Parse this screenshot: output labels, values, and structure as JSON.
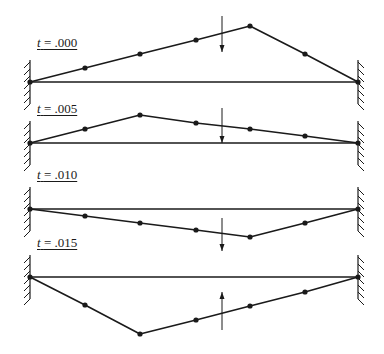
{
  "diagram": {
    "title": "",
    "colors": {
      "line": "#1a1a1a",
      "background": "#ffffff"
    },
    "panels": [
      {
        "time_var": "t",
        "time_value": "= .000",
        "label_pos": [
          37,
          36
        ],
        "baseline_y": 82,
        "points": [
          [
            30,
            82
          ],
          [
            85,
            68
          ],
          [
            140,
            54
          ],
          [
            196,
            40
          ],
          [
            250,
            26
          ],
          [
            305,
            54
          ],
          [
            358,
            82
          ]
        ],
        "arrow": {
          "x": 222,
          "y1": 16,
          "y2": 52,
          "direction": "down"
        }
      },
      {
        "time_var": "t",
        "time_value": "= .005",
        "label_pos": [
          37,
          102
        ],
        "baseline_y": 143,
        "points": [
          [
            30,
            143
          ],
          [
            85,
            129
          ],
          [
            140,
            115
          ],
          [
            196,
            123
          ],
          [
            250,
            129
          ],
          [
            305,
            136
          ],
          [
            358,
            143
          ]
        ],
        "arrow": {
          "x": 222,
          "y1": 108,
          "y2": 143,
          "direction": "down"
        }
      },
      {
        "time_var": "t",
        "time_value": "= .010",
        "label_pos": [
          37,
          168
        ],
        "baseline_y": 209,
        "points": [
          [
            30,
            209
          ],
          [
            85,
            216
          ],
          [
            140,
            223
          ],
          [
            196,
            230
          ],
          [
            250,
            237
          ],
          [
            305,
            223
          ],
          [
            358,
            209
          ]
        ],
        "arrow": {
          "x": 222,
          "y1": 218,
          "y2": 251,
          "direction": "down"
        }
      },
      {
        "time_var": "t",
        "time_value": "= .015",
        "label_pos": [
          37,
          236
        ],
        "baseline_y": 277,
        "points": [
          [
            30,
            277
          ],
          [
            85,
            305
          ],
          [
            140,
            334
          ],
          [
            196,
            320
          ],
          [
            250,
            306
          ],
          [
            305,
            292
          ],
          [
            358,
            277
          ]
        ],
        "arrow": {
          "x": 222,
          "y1": 330,
          "y2": 292,
          "direction": "up"
        }
      }
    ],
    "supports": {
      "left_x": 30,
      "right_x": 358
    }
  }
}
